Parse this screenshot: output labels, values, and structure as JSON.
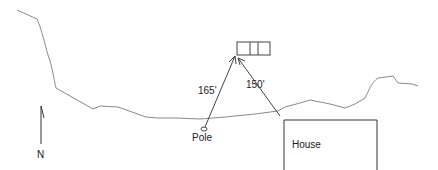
{
  "diagram": {
    "labels": {
      "pole": "Pole",
      "house": "House",
      "north": "N",
      "distance_pole": "165'",
      "distance_house": "150'"
    },
    "colors": {
      "line": "#555555",
      "curve": "#888888",
      "text": "#1a1a1a"
    }
  }
}
